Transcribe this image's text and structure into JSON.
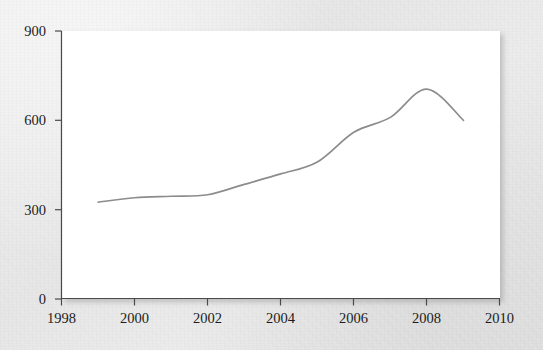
{
  "chart_data": {
    "type": "line",
    "title": "",
    "xlabel": "",
    "ylabel": "",
    "x": [
      1999,
      2000,
      2001,
      2002,
      2003,
      2004,
      2005,
      2006,
      2007,
      2008,
      2009
    ],
    "values": [
      325,
      340,
      345,
      350,
      385,
      420,
      460,
      560,
      610,
      705,
      600
    ],
    "series": [
      {
        "name": "series-1",
        "color": "#8c8c8c",
        "values": [
          325,
          340,
          345,
          350,
          385,
          420,
          460,
          560,
          610,
          705,
          600
        ]
      }
    ],
    "xlim": [
      1998,
      2010
    ],
    "ylim": [
      0,
      900
    ],
    "x_ticks": [
      1998,
      2000,
      2002,
      2004,
      2006,
      2008,
      2010
    ],
    "x_tick_labels": [
      "1998",
      "2000",
      "2002",
      "2004",
      "2006",
      "2008",
      "2010"
    ],
    "y_ticks": [
      0,
      300,
      600,
      900
    ],
    "y_tick_labels": [
      "0",
      "300",
      "600",
      "900"
    ],
    "grid": false,
    "legend": null,
    "legend_position": "none",
    "annotations": [],
    "smoothing": "spline"
  },
  "style": {
    "line_color": "#8c8c8c",
    "axis_color": "#4a4a4a",
    "tick_label_color": "#1c1c1c",
    "plot_background": "#ffffff",
    "figure_background": "#e9e9e9"
  }
}
